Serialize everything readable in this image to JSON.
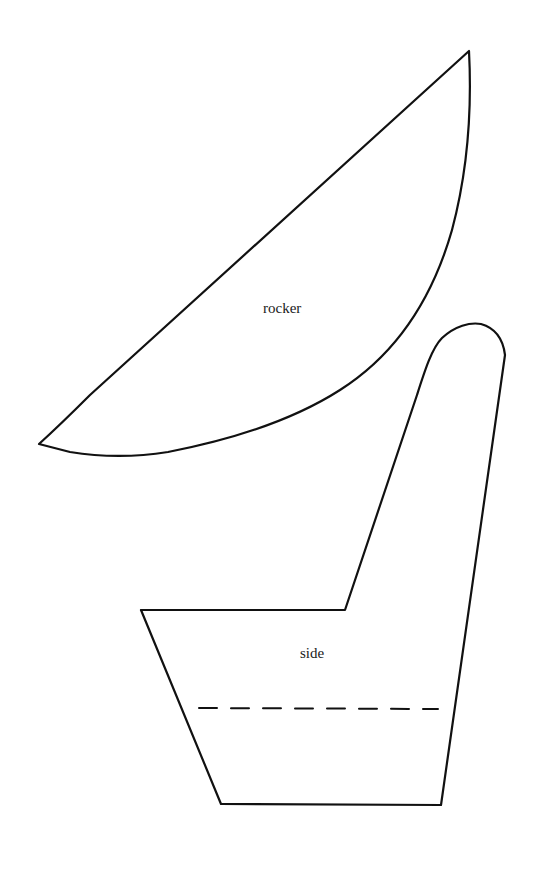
{
  "diagram": {
    "type": "sewing-pattern",
    "pieces": [
      {
        "id": "rocker",
        "label": "rocker"
      },
      {
        "id": "side",
        "label": "side",
        "has_fold_line": true
      }
    ],
    "colors": {
      "line": "#111111",
      "background": "#ffffff"
    }
  }
}
